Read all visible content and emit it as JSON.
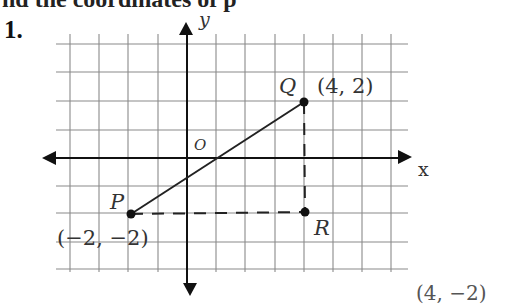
{
  "heading": "nd the coordinates of p",
  "problem_number": "1.",
  "axes": {
    "x_label": "x",
    "y_label": "y",
    "origin_label": "O"
  },
  "points": {
    "P": {
      "name": "P",
      "coords_label": "(−2, −2)",
      "x": -2,
      "y": -2
    },
    "Q": {
      "name": "Q",
      "coords_label": "(4, 2)",
      "x": 4,
      "y": 2
    },
    "R": {
      "name": "R",
      "coords_label": "(4, −2)",
      "x": 4,
      "y": -2
    }
  },
  "grid": {
    "x_range": [
      -4,
      7
    ],
    "y_range": [
      -4,
      4
    ],
    "line_color": "#8a8a8a",
    "axis_color": "#111111"
  },
  "segments": [
    {
      "from": "P",
      "to": "Q",
      "style": "solid"
    },
    {
      "from": "P",
      "to": "R",
      "style": "dashed"
    },
    {
      "from": "Q",
      "to": "R",
      "style": "dashed"
    }
  ]
}
